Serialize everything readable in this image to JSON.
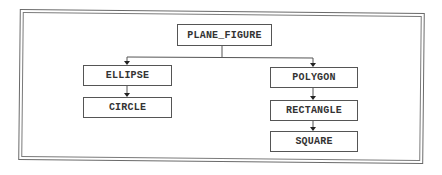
{
  "diagram": {
    "type": "class-hierarchy",
    "root": {
      "label": "PLANE_FIGURE",
      "children": [
        {
          "label": "ELLIPSE",
          "children": [
            {
              "label": "CIRCLE",
              "children": []
            }
          ]
        },
        {
          "label": "POLYGON",
          "children": [
            {
              "label": "RECTANGLE",
              "children": [
                {
                  "label": "SQUARE",
                  "children": []
                }
              ]
            }
          ]
        }
      ]
    },
    "nodes": {
      "plane_figure": "PLANE_FIGURE",
      "ellipse": "ELLIPSE",
      "circle": "CIRCLE",
      "polygon": "POLYGON",
      "rectangle": "RECTANGLE",
      "square": "SQUARE"
    },
    "edges": [
      {
        "from": "PLANE_FIGURE",
        "to": "ELLIPSE"
      },
      {
        "from": "PLANE_FIGURE",
        "to": "POLYGON"
      },
      {
        "from": "ELLIPSE",
        "to": "CIRCLE"
      },
      {
        "from": "POLYGON",
        "to": "RECTANGLE"
      },
      {
        "from": "RECTANGLE",
        "to": "SQUARE"
      }
    ],
    "colors": {
      "line": "#555555",
      "text": "#333333",
      "background": "#ffffff"
    }
  }
}
